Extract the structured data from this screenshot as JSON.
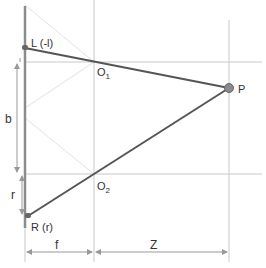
{
  "diagram": {
    "type": "stereo-camera-geometry",
    "labels": {
      "L": "L (-l)",
      "R": "R (r)",
      "O1": "O",
      "O1_sub": "1",
      "O2": "O",
      "O2_sub": "2",
      "P": "P",
      "b": "b",
      "r": "r",
      "f": "f",
      "Z": "Z"
    },
    "colors": {
      "ray": "#555555",
      "grid": "#c8c8c8",
      "faint": "#e0e0e0",
      "sensor": "#888888",
      "point": "#808080",
      "text": "#333333"
    }
  }
}
